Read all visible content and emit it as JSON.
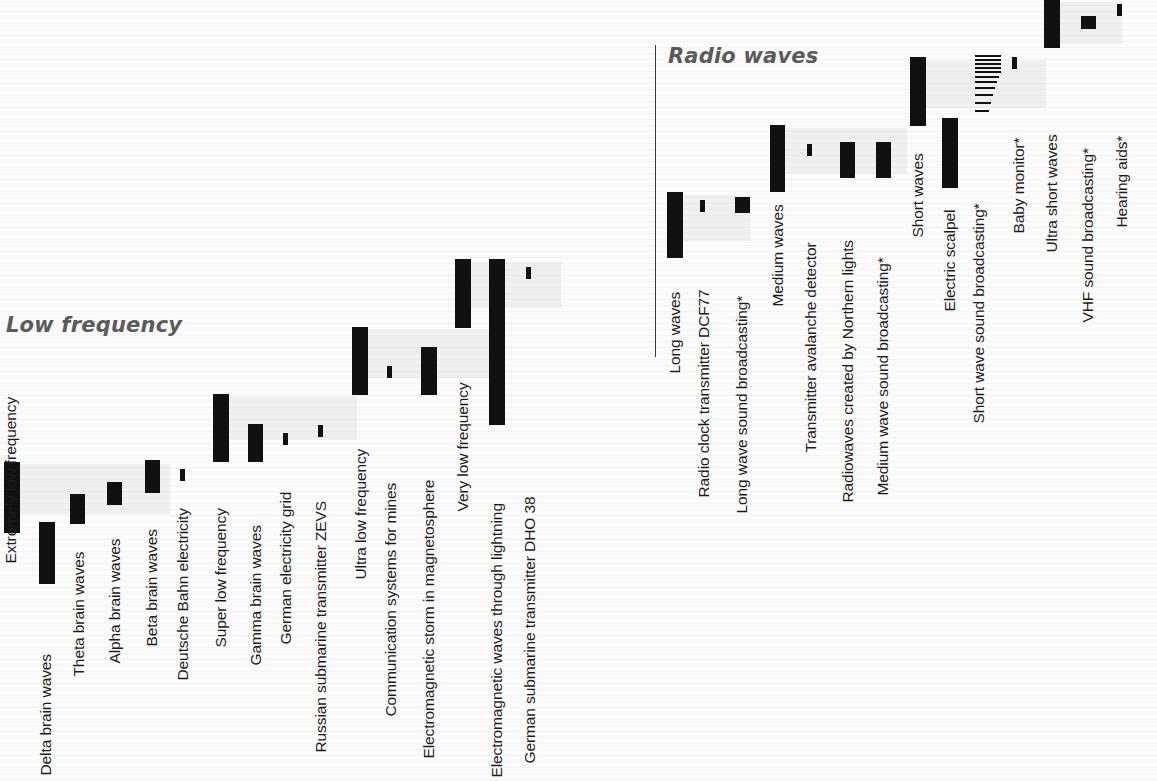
{
  "figure": {
    "background_color": "#fbfbfb",
    "bar_color": "#111111",
    "title_color": "#5b5b5b",
    "label_color": "#1b1b1b"
  },
  "sections": [
    {
      "id": "low-frequency",
      "title": "Low frequency"
    },
    {
      "id": "radio-waves",
      "title": "Radio waves"
    }
  ],
  "chart_data": {
    "type": "bar",
    "orientation": "vertical-bars-with-rotated-labels",
    "xlabel": "",
    "ylabel": "",
    "grid": false,
    "legend": "none",
    "note": "Bars are drawn as vertical segments whose vertical extent marks the frequency/wavelength span of each band or source; thin single lines mark single narrow frequencies.",
    "categories": [
      "Extremely low frequency",
      "Delta brain waves",
      "Theta brain waves",
      "Alpha brain waves",
      "Beta brain waves",
      "Deutsche Bahn electricity",
      "Super low frequency",
      "Gamma brain waves",
      "German electricity grid",
      "Russian submarine transmitter ZEVS",
      "Ultra low frequency",
      "Communication systems for mines",
      "Electromagnetic storm in magnetosphere",
      "Very low frequency",
      "Electromagnetic waves through lightning",
      "German submarine transmitter DHO 38",
      "Long waves",
      "Radio clock transmitter DCF77",
      "Long wave sound broadcasting*",
      "Medium waves",
      "Transmitter avalanche detector",
      "Radiowaves created by Northern lights",
      "Medium wave sound broadcasting*",
      "Short waves",
      "Electric scalpel",
      "Short wave sound broadcasting*",
      "Baby monitor*",
      "Ultra short waves",
      "VHF sound broadcasting*",
      "Hearing aids*"
    ]
  },
  "bars": [
    {
      "label": "Extremely low frequency",
      "kind": "band",
      "section": "low-frequency",
      "x": 4,
      "top": 462,
      "height": 71,
      "width": 16,
      "halo": {
        "x": 20,
        "y": 464,
        "w": 150,
        "h": 50
      }
    },
    {
      "label": "Delta brain waves",
      "kind": "band",
      "section": "low-frequency",
      "x": 39,
      "top": 522,
      "height": 62,
      "width": 16,
      "halo": null
    },
    {
      "label": "Theta brain waves",
      "kind": "band",
      "section": "low-frequency",
      "x": 70,
      "top": 494,
      "height": 30,
      "width": 15,
      "halo": null
    },
    {
      "label": "Alpha brain waves",
      "kind": "band",
      "section": "low-frequency",
      "x": 107,
      "top": 482,
      "height": 23,
      "width": 15,
      "halo": null
    },
    {
      "label": "Beta brain waves",
      "kind": "band",
      "section": "low-frequency",
      "x": 145,
      "top": 460,
      "height": 33,
      "width": 15,
      "halo": null
    },
    {
      "label": "Deutsche Bahn electricity",
      "kind": "tick",
      "section": "low-frequency",
      "x": 180,
      "top": 469,
      "height": 12,
      "width": 5,
      "halo": null
    },
    {
      "label": "Super low frequency",
      "kind": "band",
      "section": "low-frequency",
      "x": 213,
      "top": 394,
      "height": 68,
      "width": 16,
      "halo": {
        "x": 229,
        "y": 396,
        "w": 128,
        "h": 44
      }
    },
    {
      "label": "Gamma brain waves",
      "kind": "band",
      "section": "low-frequency",
      "x": 248,
      "top": 424,
      "height": 38,
      "width": 15,
      "halo": null
    },
    {
      "label": "German electricity grid",
      "kind": "tick",
      "section": "low-frequency",
      "x": 283,
      "top": 433,
      "height": 12,
      "width": 5,
      "halo": null
    },
    {
      "label": "Russian submarine transmitter ZEVS",
      "kind": "tick",
      "section": "low-frequency",
      "x": 318,
      "top": 425,
      "height": 12,
      "width": 5,
      "halo": null
    },
    {
      "label": "Ultra low frequency",
      "kind": "band",
      "section": "low-frequency",
      "x": 352,
      "top": 327,
      "height": 68,
      "width": 16,
      "halo": {
        "x": 368,
        "y": 330,
        "w": 122,
        "h": 48
      }
    },
    {
      "label": "Communication systems for mines",
      "kind": "tick",
      "section": "low-frequency",
      "x": 387,
      "top": 366,
      "height": 12,
      "width": 5,
      "halo": null
    },
    {
      "label": "Electromagnetic storm in magnetosphere",
      "kind": "band",
      "section": "low-frequency",
      "x": 421,
      "top": 347,
      "height": 48,
      "width": 16,
      "halo": null
    },
    {
      "label": "Very low frequency",
      "kind": "band",
      "section": "low-frequency",
      "x": 455,
      "top": 259,
      "height": 69,
      "width": 16,
      "halo": {
        "x": 471,
        "y": 262,
        "w": 90,
        "h": 46
      }
    },
    {
      "label": "Electromagnetic waves through lightning",
      "kind": "band",
      "section": "low-frequency",
      "x": 489,
      "top": 259,
      "height": 166,
      "width": 16,
      "halo": null
    },
    {
      "label": "German submarine transmitter DHO 38",
      "kind": "tick",
      "section": "low-frequency",
      "x": 526,
      "top": 267,
      "height": 12,
      "width": 5,
      "halo": null
    },
    {
      "label": "Long waves",
      "kind": "band",
      "section": "radio-waves",
      "x": 667,
      "top": 192,
      "height": 66,
      "width": 16,
      "halo": {
        "x": 683,
        "y": 195,
        "w": 68,
        "h": 46
      }
    },
    {
      "label": "Radio clock transmitter DCF77",
      "kind": "tick",
      "section": "radio-waves",
      "x": 700,
      "top": 200,
      "height": 12,
      "width": 5,
      "halo": null
    },
    {
      "label": "Long wave sound broadcasting*",
      "kind": "band",
      "section": "radio-waves",
      "x": 735,
      "top": 197,
      "height": 16,
      "width": 15,
      "halo": null
    },
    {
      "label": "Medium waves",
      "kind": "band",
      "section": "radio-waves",
      "x": 770,
      "top": 125,
      "height": 67,
      "width": 15,
      "halo": {
        "x": 785,
        "y": 128,
        "w": 122,
        "h": 46
      }
    },
    {
      "label": "Transmitter avalanche detector",
      "kind": "tick",
      "section": "radio-waves",
      "x": 807,
      "top": 144,
      "height": 12,
      "width": 5,
      "halo": null
    },
    {
      "label": "Radiowaves created by Northern lights",
      "kind": "band",
      "section": "radio-waves",
      "x": 840,
      "top": 142,
      "height": 36,
      "width": 15,
      "halo": null
    },
    {
      "label": "Medium wave sound broadcasting*",
      "kind": "band",
      "section": "radio-waves",
      "x": 876,
      "top": 142,
      "height": 36,
      "width": 15,
      "halo": null
    },
    {
      "label": "Short waves",
      "kind": "band",
      "section": "radio-waves",
      "x": 910,
      "top": 57,
      "height": 69,
      "width": 16,
      "halo": {
        "x": 926,
        "y": 60,
        "w": 120,
        "h": 48
      }
    },
    {
      "label": "Electric scalpel",
      "kind": "band",
      "section": "radio-waves",
      "x": 942,
      "top": 118,
      "height": 70,
      "width": 16,
      "halo": null
    },
    {
      "label": "Baby monitor*",
      "kind": "tick",
      "section": "radio-waves",
      "x": 1012,
      "top": 57,
      "height": 12,
      "width": 5,
      "halo": null
    },
    {
      "label": "Ultra short waves",
      "kind": "band",
      "section": "radio-waves",
      "x": 1044,
      "top": -2,
      "height": 50,
      "width": 16,
      "halo": {
        "x": 1060,
        "y": 2,
        "w": 62,
        "h": 42
      }
    },
    {
      "label": "VHF sound broadcasting*",
      "kind": "band",
      "section": "radio-waves",
      "x": 1081,
      "top": 16,
      "height": 13,
      "width": 15,
      "halo": null
    },
    {
      "label": "Hearing aids*",
      "kind": "tick",
      "section": "radio-waves",
      "x": 1117,
      "top": 4,
      "height": 12,
      "width": 5,
      "halo": null
    }
  ],
  "tick_group": {
    "label": "Short wave sound broadcasting*",
    "x": 975,
    "top": 55,
    "width": 26,
    "lines": [
      {
        "y": 0,
        "h": 2,
        "w": 26
      },
      {
        "y": 4,
        "h": 2,
        "w": 26
      },
      {
        "y": 8,
        "h": 2,
        "w": 26
      },
      {
        "y": 12,
        "h": 2,
        "w": 26
      },
      {
        "y": 16,
        "h": 2,
        "w": 26
      },
      {
        "y": 21,
        "h": 2,
        "w": 24
      },
      {
        "y": 26,
        "h": 2,
        "w": 22
      },
      {
        "y": 32,
        "h": 2,
        "w": 20
      },
      {
        "y": 39,
        "h": 2,
        "w": 18
      },
      {
        "y": 47,
        "h": 2,
        "w": 16
      },
      {
        "y": 55,
        "h": 2,
        "w": 14
      }
    ]
  },
  "axis": {
    "radio_rule": {
      "x": 655,
      "top": 45,
      "height": 312
    }
  },
  "labels": [
    {
      "text": "Extremely low frequency",
      "x": 18,
      "baseline_y": 548
    },
    {
      "text": "Delta brain waves",
      "x": 53,
      "baseline_y": 760
    },
    {
      "text": "Theta brain waves",
      "x": 86,
      "baseline_y": 661
    },
    {
      "text": "Alpha brain waves",
      "x": 122,
      "baseline_y": 648
    },
    {
      "text": "Beta brain waves",
      "x": 159,
      "baseline_y": 631
    },
    {
      "text": "Deutsche Bahn electricity",
      "x": 190,
      "baseline_y": 665
    },
    {
      "text": "Super low frequency",
      "x": 228,
      "baseline_y": 632
    },
    {
      "text": "Gamma brain waves",
      "x": 263,
      "baseline_y": 650
    },
    {
      "text": "German electricity grid",
      "x": 293,
      "baseline_y": 629
    },
    {
      "text": "Russian submarine transmitter ZEVS",
      "x": 328,
      "baseline_y": 737
    },
    {
      "text": "Ultra low frequency",
      "x": 368,
      "baseline_y": 564
    },
    {
      "text": "Communication systems for mines",
      "x": 398,
      "baseline_y": 701
    },
    {
      "text": "Electromagnetic storm in magnetosphere",
      "x": 436,
      "baseline_y": 743
    },
    {
      "text": "Very low frequency",
      "x": 470,
      "baseline_y": 496
    },
    {
      "text": "Electromagnetic waves through lightning",
      "x": 504,
      "baseline_y": 762
    },
    {
      "text": "German submarine transmitter DHO 38",
      "x": 537,
      "baseline_y": 748
    },
    {
      "text": "Long waves",
      "x": 682,
      "baseline_y": 358
    },
    {
      "text": "Radio clock transmitter DCF77",
      "x": 711,
      "baseline_y": 482
    },
    {
      "text": "Long wave sound broadcasting*",
      "x": 749,
      "baseline_y": 498
    },
    {
      "text": "Medium waves",
      "x": 785,
      "baseline_y": 291
    },
    {
      "text": "Transmitter avalanche detector",
      "x": 818,
      "baseline_y": 437
    },
    {
      "text": "Radiowaves created by Northern lights",
      "x": 855,
      "baseline_y": 487
    },
    {
      "text": "Medium wave sound broadcasting*",
      "x": 890,
      "baseline_y": 480
    },
    {
      "text": "Short waves",
      "x": 925,
      "baseline_y": 222
    },
    {
      "text": "Electric scalpel",
      "x": 957,
      "baseline_y": 296
    },
    {
      "text": "Short wave sound broadcasting*",
      "x": 986,
      "baseline_y": 408
    },
    {
      "text": "Baby monitor*",
      "x": 1026,
      "baseline_y": 218
    },
    {
      "text": "Ultra short waves",
      "x": 1059,
      "baseline_y": 237
    },
    {
      "text": "VHF sound broadcasting*",
      "x": 1095,
      "baseline_y": 307
    },
    {
      "text": "Hearing aids*",
      "x": 1129,
      "baseline_y": 212
    }
  ]
}
